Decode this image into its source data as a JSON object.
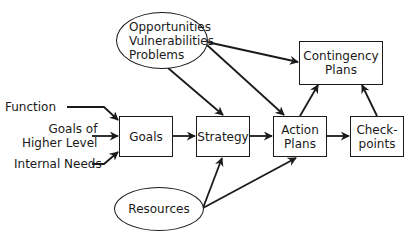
{
  "diagram": {
    "nodes": {
      "opportunities": {
        "lines": [
          "Opportunities",
          "Vulnerabilities",
          "Problems"
        ],
        "shape": "oval"
      },
      "contingency": {
        "lines": [
          "Contingency",
          "Plans"
        ],
        "shape": "box"
      },
      "goals": {
        "lines": [
          "Goals"
        ],
        "shape": "box"
      },
      "strategy": {
        "lines": [
          "Strategy"
        ],
        "shape": "box"
      },
      "action_plans": {
        "lines": [
          "Action",
          "Plans"
        ],
        "shape": "box"
      },
      "checkpoints": {
        "lines": [
          "Check-",
          "points"
        ],
        "shape": "box"
      },
      "resources": {
        "lines": [
          "Resources"
        ],
        "shape": "oval"
      }
    },
    "inputs": {
      "function": "Function",
      "goals_higher": [
        "Goals of",
        "Higher Level"
      ],
      "internal_needs": "Internal Needs"
    },
    "edges": [
      {
        "from": "Function",
        "to": "Goals"
      },
      {
        "from": "Goals of Higher Level",
        "to": "Goals"
      },
      {
        "from": "Internal Needs",
        "to": "Goals"
      },
      {
        "from": "Goals",
        "to": "Strategy"
      },
      {
        "from": "Strategy",
        "to": "Action Plans"
      },
      {
        "from": "Action Plans",
        "to": "Checkpoints"
      },
      {
        "from": "Opportunities/Vulnerabilities/Problems",
        "to": "Strategy"
      },
      {
        "from": "Opportunities/Vulnerabilities/Problems",
        "to": "Action Plans"
      },
      {
        "from": "Opportunities/Vulnerabilities/Problems",
        "to": "Contingency Plans"
      },
      {
        "from": "Action Plans",
        "to": "Contingency Plans"
      },
      {
        "from": "Checkpoints",
        "to": "Contingency Plans"
      },
      {
        "from": "Resources",
        "to": "Strategy"
      },
      {
        "from": "Resources",
        "to": "Action Plans"
      }
    ]
  }
}
